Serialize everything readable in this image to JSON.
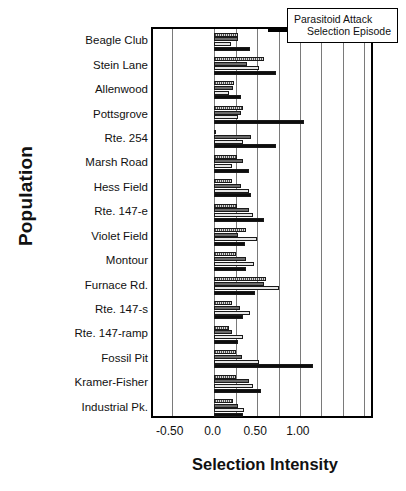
{
  "legend": {
    "line1": "Parasitoid Attack",
    "line2": "Selection Episode"
  },
  "chart_data": {
    "type": "bar",
    "orientation": "horizontal",
    "title": "",
    "xlabel": "Selection Intensity",
    "ylabel": "Population",
    "xlim": [
      -0.72,
      1.88
    ],
    "xticks": [
      -0.5,
      0.0,
      0.5,
      1.0
    ],
    "xticklabels": [
      "-0.50",
      "0.0",
      "0.50",
      "1.00"
    ],
    "grid": true,
    "grid_axis": "x",
    "legend_position": "top-right",
    "categories": [
      "Beagle Club",
      "Stein Lane",
      "Allenwood",
      "Pottsgrove",
      "Rte. 254",
      "Marsh Road",
      "Hess Field",
      "Rte. 147-e",
      "Violet Field",
      "Montour",
      "Furnace Rd.",
      "Rte. 147-s",
      "Rte. 147-ramp",
      "Fossil Pit",
      "Kramer-Fisher",
      "Industrial Pk."
    ],
    "series": [
      {
        "name": "episode-1",
        "fill": "hatch",
        "values": [
          0.28,
          0.58,
          0.23,
          0.33,
          0.02,
          0.26,
          0.21,
          0.26,
          0.37,
          0.25,
          0.6,
          0.2,
          0.17,
          0.25,
          0.25,
          0.22
        ]
      },
      {
        "name": "episode-2",
        "fill": "dark-gray",
        "values": [
          0.28,
          0.38,
          0.22,
          0.31,
          0.43,
          0.34,
          0.31,
          0.41,
          0.28,
          0.37,
          0.58,
          0.3,
          0.21,
          0.32,
          0.4,
          0.28
        ]
      },
      {
        "name": "episode-3",
        "fill": "light-gray",
        "values": [
          0.19,
          0.52,
          0.17,
          0.28,
          0.34,
          0.2,
          0.41,
          0.45,
          0.5,
          0.46,
          0.76,
          0.42,
          0.33,
          0.52,
          0.45,
          0.35
        ]
      },
      {
        "name": "episode-4",
        "fill": "black",
        "values": [
          0.42,
          0.72,
          0.31,
          1.05,
          0.72,
          0.41,
          0.43,
          0.58,
          0.36,
          0.37,
          0.47,
          0.34,
          0.28,
          1.15,
          0.55,
          0.33
        ]
      }
    ]
  }
}
